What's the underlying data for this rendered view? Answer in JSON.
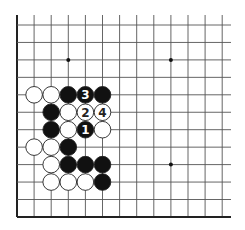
{
  "diagram": {
    "grid": {
      "origin_x": 17,
      "origin_y": 25,
      "spacing_x": 17.1,
      "spacing_y": 17.45,
      "cols": 13,
      "rows": 12,
      "right_extent": 231,
      "top_extent": 15,
      "line_color": "#555555",
      "edge_color": "#222222"
    },
    "star_points": [
      {
        "col": 3,
        "row": 2
      },
      {
        "col": 9,
        "row": 2
      },
      {
        "col": 9,
        "row": 8
      }
    ],
    "stones": [
      {
        "color": "white",
        "col": 1,
        "row": 4,
        "label": ""
      },
      {
        "color": "white",
        "col": 2,
        "row": 4,
        "label": ""
      },
      {
        "color": "black",
        "col": 3,
        "row": 4,
        "label": ""
      },
      {
        "color": "black",
        "col": 4,
        "row": 4,
        "label": "3"
      },
      {
        "color": "black",
        "col": 5,
        "row": 4,
        "label": ""
      },
      {
        "color": "black",
        "col": 2,
        "row": 5,
        "label": ""
      },
      {
        "color": "white",
        "col": 3,
        "row": 5,
        "label": ""
      },
      {
        "color": "white",
        "col": 4,
        "row": 5,
        "label": "2"
      },
      {
        "color": "white",
        "col": 5,
        "row": 5,
        "label": "4"
      },
      {
        "color": "black",
        "col": 2,
        "row": 6,
        "label": ""
      },
      {
        "color": "white",
        "col": 3,
        "row": 6,
        "label": ""
      },
      {
        "color": "black",
        "col": 4,
        "row": 6,
        "label": "1"
      },
      {
        "color": "white",
        "col": 5,
        "row": 6,
        "label": ""
      },
      {
        "color": "white",
        "col": 1,
        "row": 7,
        "label": ""
      },
      {
        "color": "white",
        "col": 2,
        "row": 7,
        "label": ""
      },
      {
        "color": "black",
        "col": 3,
        "row": 7,
        "label": ""
      },
      {
        "color": "white",
        "col": 2,
        "row": 8,
        "label": ""
      },
      {
        "color": "black",
        "col": 3,
        "row": 8,
        "label": ""
      },
      {
        "color": "black",
        "col": 4,
        "row": 8,
        "label": ""
      },
      {
        "color": "black",
        "col": 5,
        "row": 8,
        "label": ""
      },
      {
        "color": "white",
        "col": 2,
        "row": 9,
        "label": ""
      },
      {
        "color": "white",
        "col": 3,
        "row": 9,
        "label": ""
      },
      {
        "color": "white",
        "col": 4,
        "row": 9,
        "label": ""
      },
      {
        "color": "black",
        "col": 5,
        "row": 9,
        "label": ""
      }
    ],
    "move_sequence": [
      "1",
      "2",
      "3",
      "4"
    ],
    "colors": {
      "black_stone": "#111111",
      "white_stone": "#ffffff",
      "stone_outline": "#222222",
      "label_on_black": "#ffffff",
      "label_on_white": "#222222"
    }
  }
}
